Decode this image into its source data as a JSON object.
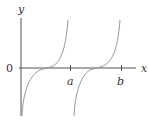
{
  "figure": {
    "type": "function-graph",
    "axes": {
      "x_label": "x",
      "y_label": "y",
      "origin_label": "0",
      "ticks": [
        {
          "label": "a"
        },
        {
          "label": "b"
        }
      ]
    },
    "curves": [
      {
        "name": "branch-1",
        "shape": "tangent-like increasing branch",
        "zero_crossing": "between 0 and a"
      },
      {
        "name": "branch-2",
        "shape": "tangent-like increasing branch",
        "zero_crossing": "between a and b"
      }
    ],
    "colors": {
      "axes": "#555555",
      "curves": "#999999",
      "text": "#333333"
    }
  }
}
